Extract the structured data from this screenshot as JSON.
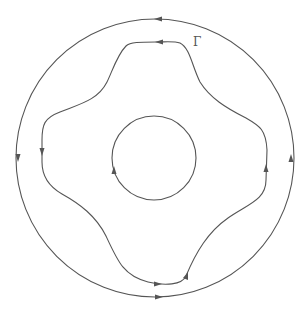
{
  "diagram": {
    "type": "contour-streamlines",
    "label": "Γ",
    "stroke_color": "#555555",
    "background": "#ffffff",
    "curves": [
      {
        "name": "outer-circle",
        "shape": "circle",
        "center": [
          155,
          158
        ],
        "radius": 139,
        "orientation": "counterclockwise"
      },
      {
        "name": "middle-contour",
        "shape": "wavy closed curve (four-lobed)",
        "orientation": "counterclockwise",
        "labeled": "Γ"
      },
      {
        "name": "inner-circle",
        "shape": "circle",
        "center": [
          154,
          158
        ],
        "radius": 42,
        "orientation": "counterclockwise"
      }
    ]
  }
}
